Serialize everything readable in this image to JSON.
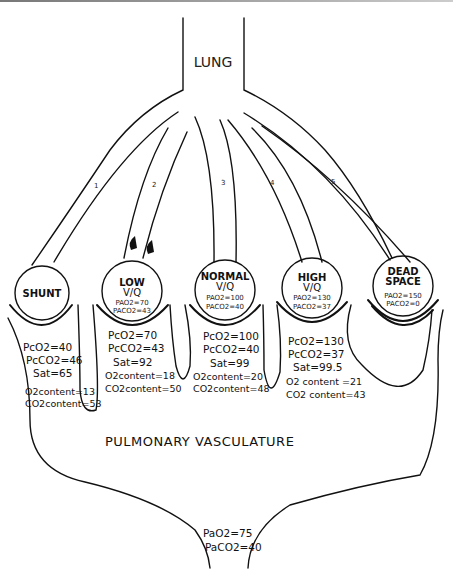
{
  "diagram": {
    "top_label": "LUNG",
    "bottom_label": "PULMONARY VASCULATURE",
    "airway_numbers": [
      "1",
      "2",
      "3",
      "4",
      "5"
    ],
    "units": [
      {
        "id": "shunt",
        "title": "SHUNT",
        "subtitle": "",
        "alveolar_gas": [],
        "capillary": [
          "PcO2=40",
          "PcCO2=46",
          "Sat=65",
          "O2content=13",
          "CO2content=53"
        ]
      },
      {
        "id": "low",
        "title": "LOW",
        "subtitle": "V/Q",
        "alveolar_gas": [
          "PAO2=70",
          "PACO2=43"
        ],
        "capillary": [
          "PcO2=70",
          "PcCO2=43",
          "Sat=92",
          "O2content=18",
          "CO2content=50"
        ]
      },
      {
        "id": "normal",
        "title": "NORMAL",
        "subtitle": "V/Q",
        "alveolar_gas": [
          "PAO2=100",
          "PACO2=40"
        ],
        "capillary": [
          "PcO2=100",
          "PcCO2=40",
          "Sat=99",
          "O2content=20",
          "CO2content=48"
        ]
      },
      {
        "id": "high",
        "title": "HIGH",
        "subtitle": "V/Q",
        "alveolar_gas": [
          "PAO2=130",
          "PACO2=37"
        ],
        "capillary": [
          "PcO2=130",
          "PcCO2=37",
          "Sat=99.5",
          "O2 content =21",
          "CO2 content=43"
        ]
      },
      {
        "id": "dead_space",
        "title": "DEAD",
        "title2": "SPACE",
        "subtitle": "",
        "alveolar_gas": [
          "PAO2=150",
          "PACO2=0"
        ],
        "capillary": []
      }
    ],
    "arterial": [
      "PaO2=75",
      "PaCO2=40"
    ]
  }
}
